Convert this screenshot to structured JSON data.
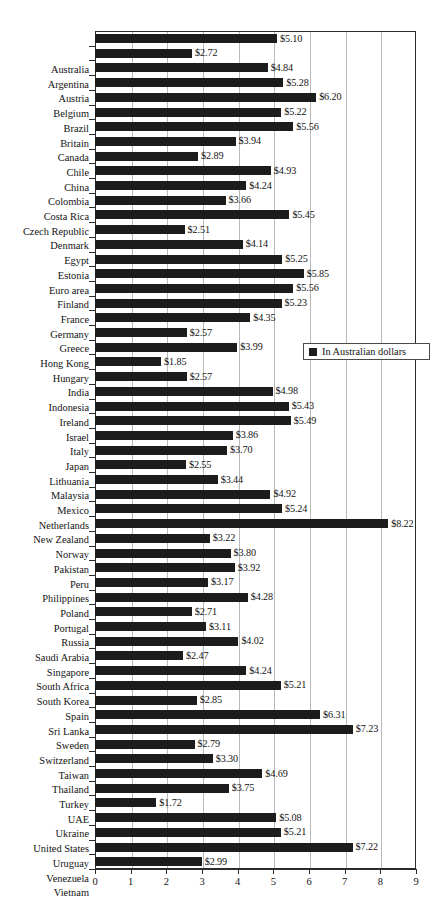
{
  "chart_data": {
    "type": "bar",
    "orientation": "horizontal",
    "title": "",
    "subtitle": "",
    "xlabel": "",
    "ylabel": "",
    "xlim": [
      0,
      9
    ],
    "xticks": [
      0,
      1,
      2,
      3,
      4,
      5,
      6,
      7,
      8,
      9
    ],
    "xtick_labels": [
      "0",
      "1",
      "2",
      "3",
      "4",
      "5",
      "6",
      "7",
      "8",
      "9"
    ],
    "grid": "vertical",
    "legend": {
      "position": "right-middle",
      "entries": [
        {
          "label": "In Australian dollars",
          "color": "#1c1c1c"
        }
      ]
    },
    "value_label_prefix": "$",
    "value_label_decimals": 2,
    "bar_color": "#1c1c1c",
    "categories": [
      "Australia",
      "Argentina",
      "Austria",
      "Belgium",
      "Brazil",
      "Britain",
      "Canada",
      "Chile",
      "China",
      "Colombia",
      "Costa Rica",
      "Czech Republic",
      "Denmark",
      "Egypt",
      "Estonia",
      "Euro area",
      "Finland",
      "France",
      "Germany",
      "Greece",
      "Hong Kong",
      "Hungary",
      "India",
      "Indonesia",
      "Ireland",
      "Israel",
      "Italy",
      "Japan",
      "Lithuania",
      "Malaysia",
      "Mexico",
      "Netherlands",
      "New Zealand",
      "Norway",
      "Pakistan",
      "Peru",
      "Philippines",
      "Poland",
      "Portugal",
      "Russia",
      "Saudi Arabia",
      "Singapore",
      "South Africa",
      "South Korea",
      "Spain",
      "Sri Lanka",
      "Sweden",
      "Switzerland",
      "Taiwan",
      "Thailand",
      "Turkey",
      "UAE",
      "Ukraine",
      "United States",
      "Uruguay",
      "Venezuela",
      "Vietnam"
    ],
    "values": [
      5.1,
      2.72,
      4.84,
      5.28,
      6.2,
      5.22,
      5.56,
      3.94,
      2.89,
      4.93,
      4.24,
      3.66,
      5.45,
      2.51,
      4.14,
      5.25,
      5.85,
      5.56,
      5.23,
      4.35,
      2.57,
      3.99,
      1.85,
      2.57,
      4.98,
      5.43,
      5.49,
      3.86,
      3.7,
      2.55,
      3.44,
      4.92,
      5.24,
      8.22,
      3.22,
      3.8,
      3.92,
      3.17,
      4.28,
      2.71,
      3.11,
      4.02,
      2.47,
      4.24,
      5.21,
      2.85,
      6.31,
      7.23,
      2.79,
      3.3,
      4.69,
      3.75,
      1.72,
      5.08,
      5.21,
      7.22,
      2.99
    ],
    "value_labels": [
      "$5.10",
      "$2.72",
      "$4.84",
      "$5.28",
      "$6.20",
      "$5.22",
      "$5.56",
      "$3.94",
      "$2.89",
      "$4.93",
      "$4.24",
      "$3.66",
      "$5.45",
      "$2.51",
      "$4.14",
      "$5.25",
      "$5.85",
      "$5.56",
      "$5.23",
      "$4.35",
      "$2.57",
      "$3.99",
      "$1.85",
      "$2.57",
      "$4.98",
      "$5.43",
      "$5.49",
      "$3.86",
      "$3.70",
      "$2.55",
      "$3.44",
      "$4.92",
      "$5.24",
      "$8.22",
      "$3.22",
      "$3.80",
      "$3.92",
      "$3.17",
      "$4.28",
      "$2.71",
      "$3.11",
      "$4.02",
      "$2.47",
      "$4.24",
      "$5.21",
      "$2.85",
      "$6.31",
      "$7.23",
      "$2.79",
      "$3.30",
      "$4.69",
      "$3.75",
      "$1.72",
      "$5.08",
      "$5.21",
      "$7.22",
      "$2.99"
    ]
  }
}
